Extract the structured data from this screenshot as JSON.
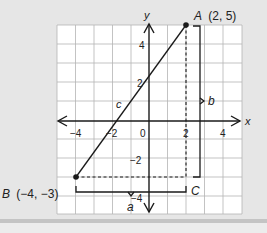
{
  "figure": {
    "axes": {
      "x_label": "x",
      "y_label": "y"
    },
    "x_ticks": [
      {
        "value": -4,
        "label": "−4"
      },
      {
        "value": -2,
        "label": "−2"
      },
      {
        "value": 0,
        "label": "0"
      },
      {
        "value": 2,
        "label": "2"
      },
      {
        "value": 4,
        "label": "4"
      }
    ],
    "y_ticks": [
      {
        "value": 4,
        "label": "4"
      },
      {
        "value": 2,
        "label": "2"
      },
      {
        "value": -2,
        "label": "−2"
      },
      {
        "value": -4,
        "label": "−4"
      }
    ],
    "points": {
      "A": {
        "name": "A",
        "coords": "(2, 5)",
        "x": 2,
        "y": 5
      },
      "B": {
        "name": "B",
        "coords": "(−4, −3)",
        "x": -4,
        "y": -3
      },
      "C": {
        "name": "C",
        "x": 2,
        "y": -3
      }
    },
    "segments": {
      "hypotenuse": "c",
      "horizontal_leg": "a",
      "vertical_leg": "b"
    },
    "grid": {
      "x_min": -5,
      "x_max": 5,
      "y_min": -5,
      "y_max": 5
    },
    "colors": {
      "background": "#e6e6e6",
      "grid_bg": "#ffffff",
      "grid_line": "#b4b4b4",
      "ink": "#1a1a1a"
    }
  }
}
